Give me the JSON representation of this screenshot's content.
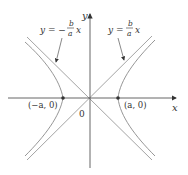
{
  "diagram": {
    "type": "hyperbola with asymptotes",
    "axes": {
      "x_label": "x",
      "y_label": "y",
      "origin_label": "0"
    },
    "vertices": [
      {
        "label": "(−a, 0)"
      },
      {
        "label": "(a, 0)"
      }
    ],
    "asymptotes": [
      {
        "label_lhs": "y = −",
        "frac_num": "b",
        "frac_den": "a",
        "label_rhs": "x"
      },
      {
        "label_lhs": "y = ",
        "frac_num": "b",
        "frac_den": "a",
        "label_rhs": "x"
      }
    ],
    "colors": {
      "axis": "#555555",
      "curve": "#888888",
      "asymptote": "#999999",
      "text": "#333333"
    }
  }
}
